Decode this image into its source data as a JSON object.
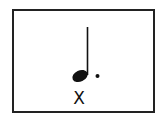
{
  "figure": {
    "type": "music-notation",
    "note": "dotted-quarter-note",
    "label": "X",
    "ink_color": "#111111",
    "border_color": "#222222",
    "background": "#ffffff"
  }
}
